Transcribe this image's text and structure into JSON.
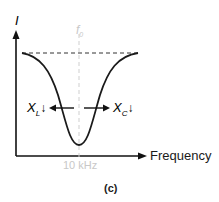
{
  "diagram": {
    "y_axis_label": "I",
    "x_axis_label": "Frequency",
    "resonant_label": "f",
    "resonant_subscript": "0",
    "resonant_value": "10 kHz",
    "left_label": "X",
    "left_subscript": "L",
    "left_arrow": "↓",
    "right_label": "X",
    "right_subscript": "C",
    "right_arrow": "↓",
    "caption": "(c)",
    "colors": {
      "curve": "#1a1a1a",
      "guide": "#cfcfcf",
      "dashed": "#333333",
      "faded_text": "#c8c8c8"
    }
  }
}
